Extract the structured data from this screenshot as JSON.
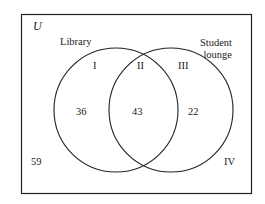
{
  "diagram": {
    "type": "venn",
    "universe_label": "U",
    "sets": [
      {
        "name": "Library"
      },
      {
        "name_line1": "Student",
        "name_line2": "lounge"
      }
    ],
    "regions": {
      "I": {
        "label": "I",
        "value": "36"
      },
      "II": {
        "label": "II",
        "value": "43"
      },
      "III": {
        "label": "III",
        "value": "22"
      },
      "IV": {
        "label": "IV",
        "value": "59"
      }
    },
    "colors": {
      "stroke": "#222222",
      "background": "#ffffff"
    }
  }
}
